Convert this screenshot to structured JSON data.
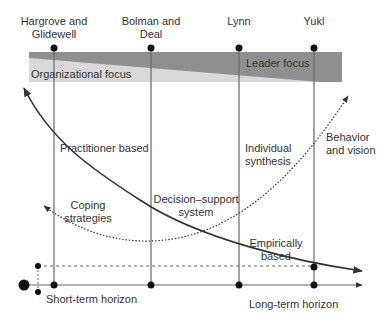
{
  "diagram": {
    "type": "conceptual-framework",
    "authors": [
      {
        "name": "Hargrove and Glidewell",
        "line1": "Hargrove and",
        "line2": "Glidewell",
        "x": 54
      },
      {
        "name": "Bolman and Deal",
        "line1": "Bolman and",
        "line2": "Deal",
        "x": 151
      },
      {
        "name": "Lynn",
        "line1": "Lynn",
        "line2": "",
        "x": 239
      },
      {
        "name": "Yukl",
        "line1": "Yukl",
        "line2": "",
        "x": 314
      }
    ],
    "band": {
      "left_label": "Organizational focus",
      "right_label": "Leader focus",
      "light_color": "#d9d9d9",
      "dark_color": "#8f8f8f"
    },
    "approaches": {
      "practitioner": "Practitioner based",
      "coping_1": "Coping",
      "coping_2": "strategies",
      "decision_1": "Decision–support",
      "decision_2": "system",
      "individual_1": "Individual",
      "individual_2": "synthesis",
      "behavior_1": "Behavior",
      "behavior_2": "and vision",
      "empirical_1": "Empirically",
      "empirical_2": "based"
    },
    "axis": {
      "short_term": "Short-term horizon",
      "long_term": "Long-term horizon"
    },
    "curves": [
      {
        "name": "empirical-curve",
        "style": "solid",
        "direction": "decreasing"
      },
      {
        "name": "practice-curve",
        "style": "dotted",
        "direction": "u-shape"
      }
    ],
    "colors": {
      "line": "#555555",
      "curve": "#333333",
      "dot": "#111111"
    }
  }
}
